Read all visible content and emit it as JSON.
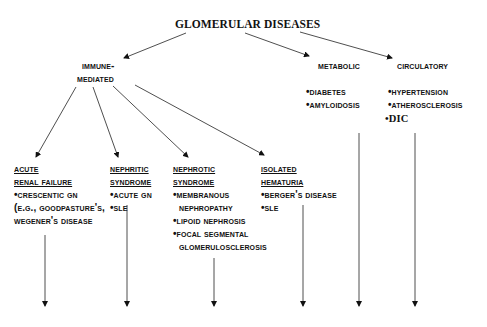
{
  "title": "GLOMERULAR DISEASES",
  "categories": {
    "immune": {
      "line1": "IMMUNE-",
      "line2": "MEDIATED"
    },
    "metabolic": {
      "label": "METABOLIC",
      "items": [
        "•DIABETES",
        "•AMYLOIDOSIS"
      ]
    },
    "circulatory": {
      "label": "CIRCULATORY",
      "items": [
        "•HYPERTENSION",
        "•ATHEROSCLEROSIS",
        "•DIC"
      ]
    }
  },
  "subcategories": {
    "acute_renal_failure": {
      "title1": "ACUTE",
      "title2": "RENAL FAILURE",
      "items": [
        "•CRESCENTIC GN",
        "(E.G., GOODPASTURE'S,",
        "WEGENER'S DISEASE"
      ]
    },
    "nephritic": {
      "title1": "NEPHRITIC",
      "title2": "SYNDROME",
      "items": [
        "•ACUTE GN",
        "•SLE"
      ]
    },
    "nephrotic": {
      "title1": "NEPHROTIC",
      "title2": "SYNDROME",
      "items": [
        "•MEMBRANOUS",
        "NEPHROPATHY",
        "•LIPOID NEPHROSIS",
        "•FOCAL SEGMENTAL",
        "GLOMERULOSCLEROSIS"
      ]
    },
    "isolated_hematuria": {
      "title1": "ISOLATED",
      "title2": "HEMATURIA",
      "items": [
        "•BERGER'S DISEASE",
        "•SLE"
      ]
    }
  }
}
